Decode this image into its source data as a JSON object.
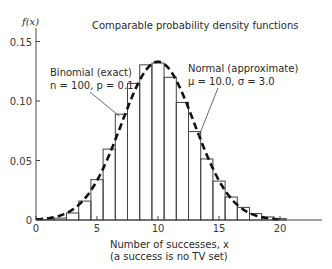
{
  "chart_data": {
    "type": "bar",
    "title": "Comparable probability density functions",
    "xlabel": "Number of successes, x",
    "xlabel_note": "(a success is no TV set)",
    "ylabel": "f(x)",
    "xlim": [
      0,
      20
    ],
    "ylim": [
      0,
      0.15
    ],
    "x_ticks": [
      "0",
      "5",
      "10",
      "15",
      "20"
    ],
    "y_ticks": [
      "0",
      "0.05",
      "0.10",
      "0.15"
    ],
    "grid": false,
    "x": [
      0,
      1,
      2,
      3,
      4,
      5,
      6,
      7,
      8,
      9,
      10,
      11,
      12,
      13,
      14,
      15,
      16,
      17,
      18,
      19,
      20
    ],
    "series": [
      {
        "name": "Binomial (exact)",
        "params": "n = 100, p = 0.1",
        "style": "bars",
        "values": [
          0.0,
          0.0003,
          0.0016,
          0.0059,
          0.0159,
          0.0339,
          0.0596,
          0.0889,
          0.1148,
          0.1304,
          0.1319,
          0.1199,
          0.0988,
          0.0743,
          0.0513,
          0.0327,
          0.0193,
          0.0106,
          0.0054,
          0.0026,
          0.0012
        ]
      },
      {
        "name": "Normal (approximate)",
        "params": "μ = 10.0, σ = 3.0",
        "style": "dashed-curve",
        "mean": 10.0,
        "sd": 3.0
      }
    ],
    "annotations": [
      {
        "text": "Binomial (exact)",
        "line2": "n = 100, p = 0.1",
        "points_to": "bar at x=7"
      },
      {
        "text": "Normal (approximate)",
        "line2": "μ = 10.0, σ = 3.0",
        "points_to": "curve near x=13"
      }
    ]
  },
  "labels": {
    "title": "Comparable probability density functions",
    "ylabel": "f(x)",
    "xlabel": "Number of successes, x",
    "xlabel_note": "(a success is no TV set)",
    "binomial_title": "Binomial (exact)",
    "binomial_params": "n = 100, p = 0.1",
    "normal_title": "Normal (approximate)",
    "normal_params": "μ = 10.0, σ = 3.0"
  }
}
